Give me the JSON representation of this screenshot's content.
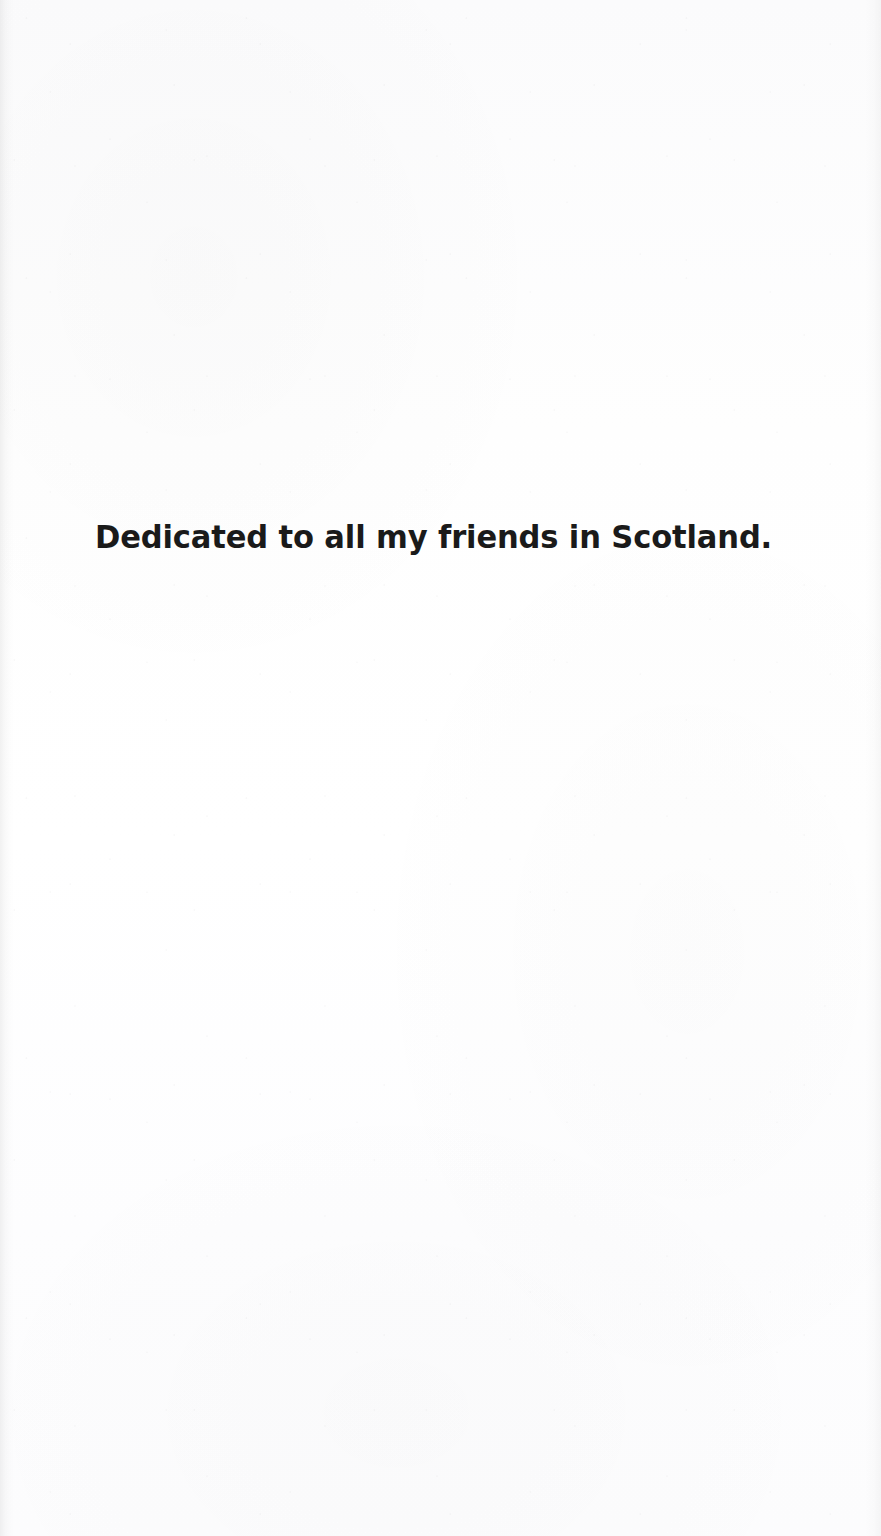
{
  "page": {
    "kind": "book-dedication-page",
    "background_color": "#fdfdfd",
    "text_color": "#1a1a1a"
  },
  "dedication": {
    "text": "Dedicated to all my friends in Scotland."
  }
}
